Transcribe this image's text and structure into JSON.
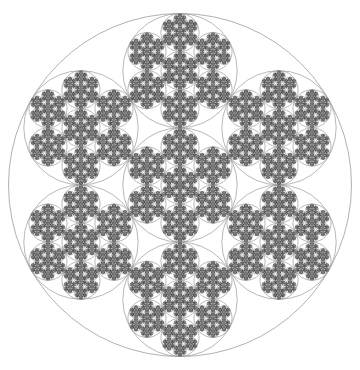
{
  "figure": {
    "width": 360,
    "height": 370,
    "background": "#ffffff",
    "fractal": {
      "type": "recursive-circle-packing-hexaflake",
      "center_x": 180,
      "center_y": 185,
      "radius": 171.5,
      "depth": 5,
      "children_per_circle": 7,
      "child_scale": 0.333333,
      "child_distance_ratio": 0.666667,
      "child_angles_deg": [
        30,
        90,
        150,
        210,
        270,
        330
      ],
      "outline_color": "#999999",
      "outline_width_px": 0.7,
      "outer_outline_color": "#8f8f8f",
      "leaf_fill": "#4c4c4c",
      "leaf_radius_ratio": 1.12
    }
  }
}
